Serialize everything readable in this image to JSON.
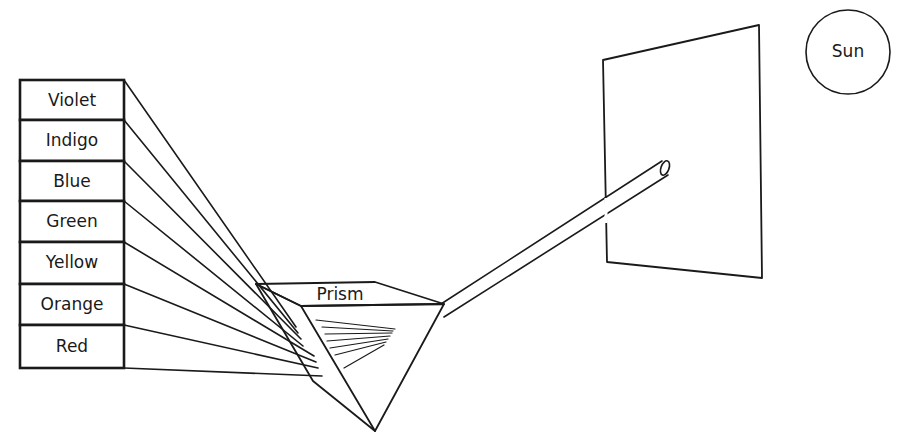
{
  "colors": {
    "ink": "#1a1a1a",
    "background": "#ffffff"
  },
  "spectrum": {
    "labels": [
      "Violet",
      "Indigo",
      "Blue",
      "Green",
      "Yellow",
      "Orange",
      "Red"
    ]
  },
  "prism": {
    "label": "Prism"
  },
  "sun": {
    "label": "Sun"
  },
  "screen": {
    "label": ""
  }
}
